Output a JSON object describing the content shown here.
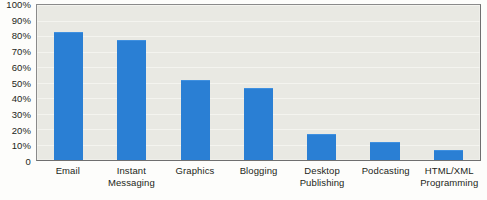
{
  "chart_data": {
    "type": "bar",
    "title": "",
    "subtitle": "",
    "xlabel": "",
    "ylabel": "",
    "ylim": [
      0,
      100
    ],
    "grid": true,
    "legend": false,
    "legend_position": "none",
    "bar_color": "#2a7fd4",
    "plot_background": "#e9e9e3",
    "categories": [
      "Email",
      "Instant Messaging",
      "Graphics",
      "Blogging",
      "Desktop Publishing",
      "Podcasting",
      "HTML/XML Programming"
    ],
    "category_lines": [
      [
        "Email"
      ],
      [
        "Instant",
        "Messaging"
      ],
      [
        "Graphics"
      ],
      [
        "Blogging"
      ],
      [
        "Desktop",
        "Publishing"
      ],
      [
        "Podcasting"
      ],
      [
        "HTML/XML",
        "Programming"
      ]
    ],
    "values": [
      82,
      77,
      51,
      46,
      16,
      11,
      6
    ],
    "ytick_labels": [
      "100%",
      "90%",
      "80%",
      "70%",
      "60%",
      "50%",
      "40%",
      "30%",
      "20%",
      "10%",
      "0"
    ],
    "ytick_values": [
      100,
      90,
      80,
      70,
      60,
      50,
      40,
      30,
      20,
      10,
      0
    ]
  }
}
